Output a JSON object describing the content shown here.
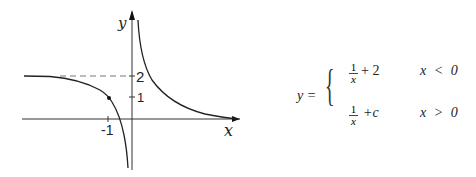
{
  "graph": {
    "axis_labels": {
      "x": "x",
      "y": "y"
    },
    "ticks": {
      "x_neg1": "-1",
      "y_1": "1",
      "y_2": "2"
    },
    "asymptote_y": 2
  },
  "equation": {
    "lhs": "y =",
    "case1": {
      "num": "1",
      "den": "x",
      "tail": "+ 2",
      "condition": "x < 0"
    },
    "case2": {
      "num": "1",
      "den": "x",
      "tail": "+c",
      "condition": "x > 0"
    }
  }
}
